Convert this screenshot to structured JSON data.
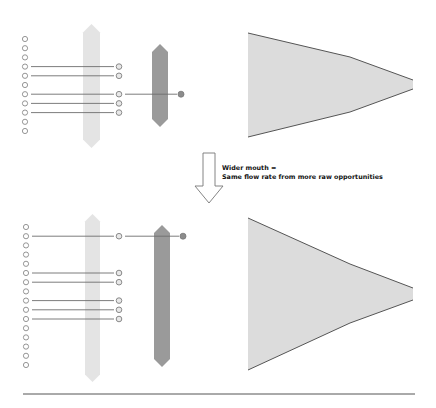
{
  "caption": {
    "line1": "Wider mouth =",
    "line2": "Same flow rate from more raw opportunities"
  },
  "colors": {
    "background": "#ffffff",
    "circle_stroke": "#8a8a8a",
    "line": "#6e6e6e",
    "light_bar": "#e4e4e4",
    "dark_bar": "#9a9a9a",
    "final_dot": "#8c8c8c",
    "funnel_fill": "#dcdcdc",
    "funnel_edge": "#555555",
    "rule": "#555555"
  },
  "panels": [
    {
      "name": "narrow-mouth",
      "raw_opportunities": {
        "count": 11,
        "x": 25,
        "y0": 39,
        "spacing": 9.2
      },
      "advancing_indices": [
        3,
        4,
        6,
        7,
        8
      ],
      "stage1_x": 119,
      "light_bar": {
        "x": 83,
        "w": 17,
        "top": 24,
        "bottom": 148
      },
      "dark_bar": {
        "x": 152,
        "w": 16,
        "top": 44,
        "bottom": 127
      },
      "final_dot": {
        "x": 181,
        "from_index": 6
      },
      "funnel": {
        "left": 248,
        "top": 33,
        "bottom": 137,
        "bend_x": 350,
        "bend_top": 57,
        "bend_bottom": 112,
        "right": 413,
        "mouth_top": 80,
        "mouth_bottom": 89
      }
    },
    {
      "name": "wide-mouth",
      "raw_opportunities": {
        "count": 16,
        "x": 26,
        "y0": 227,
        "spacing": 9.2
      },
      "advancing_indices": [
        1,
        5,
        6,
        8,
        9,
        10
      ],
      "stage1_x": 119,
      "light_bar": {
        "x": 85,
        "w": 15,
        "top": 214,
        "bottom": 382
      },
      "dark_bar": {
        "x": 154,
        "w": 16,
        "top": 225,
        "bottom": 367
      },
      "final_dot": {
        "x": 183,
        "from_index": 1
      },
      "funnel": {
        "left": 248,
        "top": 218,
        "bottom": 370,
        "bend_x": 350,
        "bend_top": 264,
        "bend_bottom": 323,
        "right": 413,
        "mouth_top": 288,
        "mouth_bottom": 300
      }
    }
  ],
  "arrow": {
    "shaft_left": 203,
    "shaft_right": 215,
    "top": 153,
    "head_y": 186,
    "head_left": 195,
    "head_right": 223,
    "tip_y": 203
  },
  "rule": {
    "x1": 23,
    "x2": 415,
    "y": 394
  }
}
